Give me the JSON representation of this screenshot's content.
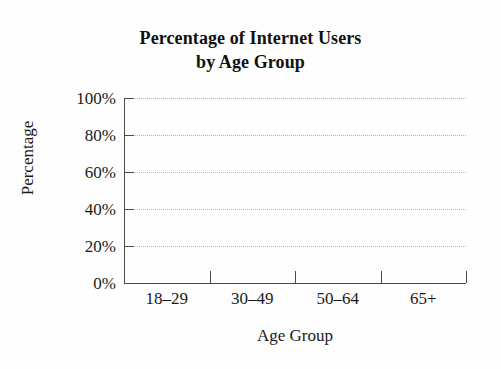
{
  "figure": {
    "title_line1": "Percentage of Internet Users",
    "title_line2": "by Age Group",
    "background_color": "#fefefe",
    "axis_color": "#4a4a4a",
    "gridline_color": "#b4b4b4",
    "text_color": "#1a1a1a"
  },
  "axes": {
    "x_title": "Age Group",
    "y_title": "Percentage"
  },
  "chart_data": {
    "type": "bar",
    "title": "Percentage of Internet Users by Age Group",
    "xlabel": "Age Group",
    "ylabel": "Percentage",
    "categories": [
      "18–29",
      "30–49",
      "50–64",
      "65+"
    ],
    "values": [
      null,
      null,
      null,
      null
    ],
    "values_note": "Blank chart template — no bars are plotted in the figure",
    "ylim": [
      0,
      100
    ],
    "y_ticks": [
      0,
      20,
      40,
      60,
      80,
      100
    ],
    "y_tick_labels": [
      "0%",
      "20%",
      "40%",
      "60%",
      "80%",
      "100%"
    ],
    "grid": "horizontal dotted gridlines only",
    "legend": null
  }
}
